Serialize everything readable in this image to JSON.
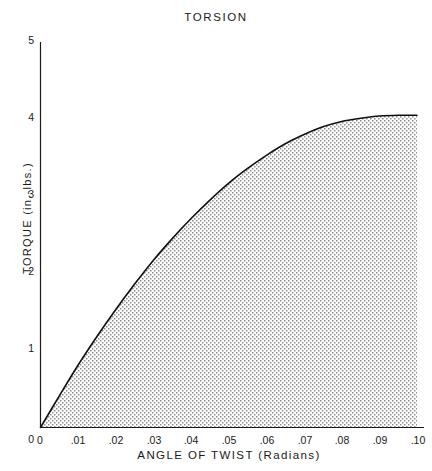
{
  "chart_data": {
    "type": "area",
    "title": "TORSION",
    "xlabel": "ANGLE OF TWIST (Radians)",
    "ylabel": "TORQUE (in.-lbs.)",
    "xlim": [
      0,
      0.1
    ],
    "ylim": [
      0,
      5
    ],
    "grid": false,
    "legend": null,
    "xticklabels": [
      "0",
      ".01",
      ".02",
      ".03",
      ".04",
      ".05",
      ".06",
      ".07",
      ".08",
      ".09",
      ".10"
    ],
    "xtickvalues": [
      0,
      0.01,
      0.02,
      0.03,
      0.04,
      0.05,
      0.06,
      0.07,
      0.08,
      0.09,
      0.1
    ],
    "yticklabels": [
      "0",
      "1",
      "2",
      "3",
      "4",
      "5"
    ],
    "ytickvalues": [
      0,
      1,
      2,
      3,
      4,
      5
    ],
    "series": [
      {
        "name": "Torque vs angle of twist",
        "fill": "stipple",
        "x": [
          0,
          0.005,
          0.01,
          0.015,
          0.02,
          0.025,
          0.03,
          0.035,
          0.04,
          0.045,
          0.05,
          0.055,
          0.06,
          0.065,
          0.07,
          0.075,
          0.08,
          0.085,
          0.09,
          0.095,
          0.1
        ],
        "y": [
          0,
          0.41,
          0.81,
          1.18,
          1.53,
          1.86,
          2.17,
          2.45,
          2.71,
          2.95,
          3.17,
          3.36,
          3.53,
          3.68,
          3.8,
          3.9,
          3.97,
          4.01,
          4.04,
          4.05,
          4.05
        ]
      }
    ],
    "colors": {
      "axis": "#1a1a1a",
      "curve": "#111111",
      "fill_dots": "#8c8c8c",
      "background": "#ffffff"
    }
  }
}
